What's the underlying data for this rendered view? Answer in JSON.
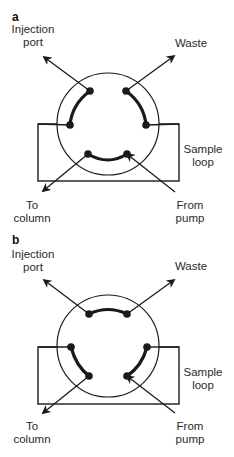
{
  "figure": {
    "panels": [
      {
        "id": "a",
        "letter": "a",
        "state": "load",
        "labels": {
          "injection_port": [
            "Injection",
            "port"
          ],
          "waste": "Waste",
          "sample_loop": [
            "Sample",
            "loop"
          ],
          "to_column": [
            "To",
            "column"
          ],
          "from_pump": [
            "From",
            "pump"
          ]
        },
        "connections": [
          [
            "injection-port",
            "loop-left"
          ],
          [
            "waste",
            "loop-right"
          ],
          [
            "to-column",
            "from-pump"
          ]
        ]
      },
      {
        "id": "b",
        "letter": "b",
        "state": "inject",
        "labels": {
          "injection_port": [
            "Injection",
            "port"
          ],
          "waste": "Waste",
          "sample_loop": [
            "Sample",
            "loop"
          ],
          "to_column": [
            "To",
            "column"
          ],
          "from_pump": [
            "From",
            "pump"
          ]
        },
        "connections": [
          [
            "injection-port",
            "waste"
          ],
          [
            "loop-left",
            "to-column"
          ],
          [
            "loop-right",
            "from-pump"
          ]
        ]
      }
    ],
    "colors": {
      "line": "#1a1a1a",
      "background": "#ffffff"
    }
  }
}
